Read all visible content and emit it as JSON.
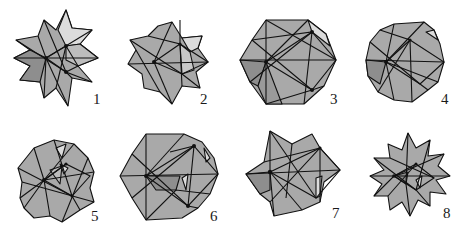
{
  "figure": {
    "colors": {
      "background": "#ffffff",
      "face_mid": "#a9a9a9",
      "face_light": "#dcdcdc",
      "face_dark": "#8e8e8e",
      "edge": "#111111",
      "label": "#1a1a1a"
    },
    "items": [
      {
        "id": 1,
        "label": "1",
        "shape": "spiky-star-cluster"
      },
      {
        "id": 2,
        "label": "2",
        "shape": "compact-star-cluster"
      },
      {
        "id": 3,
        "label": "3",
        "shape": "icosahedron-like"
      },
      {
        "id": 4,
        "label": "4",
        "shape": "rounded-faceted"
      },
      {
        "id": 5,
        "label": "5",
        "shape": "hexagonal-star-cluster"
      },
      {
        "id": 6,
        "label": "6",
        "shape": "faceted-hexagon"
      },
      {
        "id": 7,
        "label": "7",
        "shape": "six-point-star"
      },
      {
        "id": 8,
        "label": "8",
        "shape": "great-stellated-spiky"
      }
    ]
  }
}
